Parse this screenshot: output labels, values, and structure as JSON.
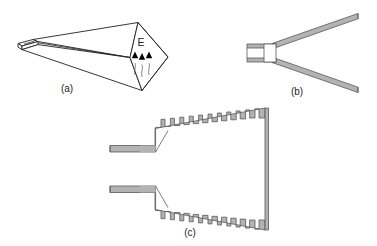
{
  "figure": {
    "type": "technical-line-diagram",
    "background_color": "#ffffff",
    "line_color": "#231f20",
    "wall_fill_color": "#b3b3b3",
    "wall_fill_light": "#d9d9d9",
    "interior_color": "#ffffff"
  },
  "panels": [
    {
      "id": "a",
      "caption": "(a)",
      "view": "perspective",
      "description": "Pyramidal horn flaring from rectangular waveguide to diamond-shaped aperture",
      "field_label": "E",
      "field_arrow_count": 3,
      "field_arrow_direction": "up",
      "filled": false
    },
    {
      "id": "b",
      "caption": "(b)",
      "view": "cross-section",
      "description": "Smooth-wall pyramidal horn cross-section with stepped waveguide throat",
      "corrugation_count": 0,
      "filled": true
    },
    {
      "id": "c",
      "caption": "(c)",
      "view": "cross-section",
      "description": "Corrugated pyramidal horn cross-section with slotted walls",
      "corrugation_count_per_side": 12,
      "filled": true
    }
  ],
  "captions": {
    "a": "(a)",
    "b": "(b)",
    "c": "(c)"
  },
  "annotations": {
    "e_field": "E"
  }
}
